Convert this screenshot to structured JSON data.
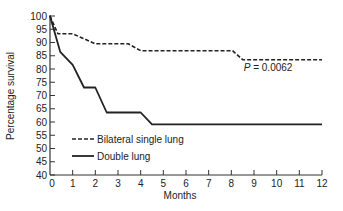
{
  "chart_data": {
    "type": "line",
    "title": "",
    "xlabel": "Months",
    "ylabel": "Percentage survival",
    "xlim": [
      0,
      12
    ],
    "ylim": [
      40,
      100
    ],
    "xticks": [
      0,
      1,
      2,
      3,
      4,
      5,
      6,
      7,
      8,
      9,
      10,
      11,
      12
    ],
    "yticks": [
      40,
      45,
      50,
      55,
      60,
      65,
      70,
      75,
      80,
      85,
      90,
      95,
      100
    ],
    "grid": false,
    "legend_position": "bottom-left",
    "annotation": {
      "text_prefix": "P",
      "text_rest": " = 0.0062",
      "x": 8.9,
      "y": 80.5
    },
    "series": [
      {
        "name": "Bilateral single lung",
        "style": "dashed",
        "color": "#222222",
        "points": [
          [
            0,
            100
          ],
          [
            0.35,
            93.3
          ],
          [
            1.0,
            93.3
          ],
          [
            2.0,
            89.5
          ],
          [
            3.45,
            89.5
          ],
          [
            4.0,
            86.9
          ],
          [
            8.05,
            86.9
          ],
          [
            8.5,
            83.5
          ],
          [
            12,
            83.5
          ]
        ]
      },
      {
        "name": "Double lung",
        "style": "solid",
        "color": "#222222",
        "points": [
          [
            0,
            100
          ],
          [
            0.45,
            86.5
          ],
          [
            1.0,
            81.6
          ],
          [
            1.5,
            73.0
          ],
          [
            2.0,
            73.0
          ],
          [
            2.5,
            63.6
          ],
          [
            4.0,
            63.6
          ],
          [
            4.5,
            59.1
          ],
          [
            12,
            59.1
          ]
        ]
      }
    ]
  }
}
